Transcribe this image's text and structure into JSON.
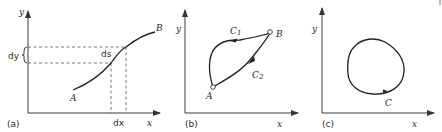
{
  "figure": {
    "panels": [
      {
        "id": "a",
        "caption": "(a)",
        "axes": {
          "x_label": "x",
          "y_label": "y"
        },
        "curve": {
          "start_label": "A",
          "end_label": "B"
        },
        "annotations": {
          "dy": "dy",
          "ds": "ds",
          "dx": "dx"
        }
      },
      {
        "id": "b",
        "caption": "(b)",
        "axes": {
          "x_label": "x",
          "y_label": "y"
        },
        "points": {
          "start": "A",
          "end": "B"
        },
        "paths": [
          {
            "label": "C",
            "sub": "1"
          },
          {
            "label": "C",
            "sub": "2"
          }
        ]
      },
      {
        "id": "c",
        "caption": "(c)",
        "axes": {
          "x_label": "x",
          "y_label": "y"
        },
        "closed_curve": {
          "label": "C"
        }
      }
    ]
  }
}
